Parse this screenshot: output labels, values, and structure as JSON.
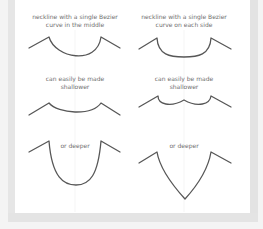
{
  "figure": {
    "panels": [
      {
        "id": "top-left",
        "caption_line1": "neckline with a single Bezier",
        "caption_line2": "curve in the middle"
      },
      {
        "id": "top-right",
        "caption_line1": "neckline with a single Bezier",
        "caption_line2": "curve on each side"
      },
      {
        "id": "middle-left",
        "caption_line1": "can easily be made",
        "caption_line2": "shallower"
      },
      {
        "id": "middle-right",
        "caption_line1": "can easily be made",
        "caption_line2": "shallower"
      },
      {
        "id": "bottom-left",
        "caption_line1": "or deeper"
      },
      {
        "id": "bottom-right",
        "caption_line1": "or deeper"
      }
    ],
    "colors": {
      "stroke": "#575757",
      "text": "#6f6f6f",
      "panel_bg": "#ffffff",
      "frame": "#e4e4e4"
    }
  }
}
